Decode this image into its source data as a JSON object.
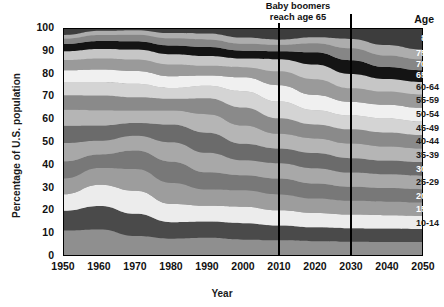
{
  "chart_data": {
    "type": "area",
    "title": "",
    "xlabel": "Year",
    "ylabel": "Percentage of U.S. population",
    "xlim": [
      1950,
      2050
    ],
    "ylim": [
      0,
      100
    ],
    "xticks": [
      "1950",
      "1960",
      "1970",
      "1980",
      "1990",
      "2000",
      "2010",
      "2020",
      "2030",
      "2040",
      "2050"
    ],
    "yticks": [
      "0",
      "10",
      "20",
      "30",
      "40",
      "50",
      "60",
      "70",
      "80",
      "90",
      "100"
    ],
    "grid": false,
    "legend_position": "right-overlay",
    "legend_header": "Age",
    "stacking": "percent",
    "annotations": [
      {
        "text": "Baby boomers reach age 65",
        "year": 2010
      },
      {
        "text": "",
        "year": 2030
      }
    ],
    "marker_years": [
      2010,
      2030
    ],
    "x": [
      1950,
      1960,
      1970,
      1980,
      1990,
      2000,
      2010,
      2020,
      2030,
      2040,
      2050
    ],
    "series": [
      {
        "name": "0-4",
        "color": "#8f8f8f",
        "values": [
          10.8,
          11.3,
          8.4,
          7.2,
          7.6,
          6.8,
          6.5,
          6.1,
          5.9,
          5.8,
          5.7
        ]
      },
      {
        "name": "5-9",
        "color": "#4a4a4a",
        "values": [
          8.8,
          10.4,
          9.8,
          7.3,
          7.2,
          7.3,
          6.6,
          6.2,
          6.0,
          5.9,
          5.8
        ]
      },
      {
        "name": "10-14",
        "color": "#ececec",
        "values": [
          7.3,
          9.4,
          10.2,
          8.1,
          7.0,
          7.3,
          6.7,
          6.3,
          6.0,
          5.9,
          5.8
        ]
      },
      {
        "name": "15-19",
        "color": "#9d9d9d",
        "values": [
          7.0,
          7.4,
          9.6,
          9.3,
          7.2,
          7.2,
          7.0,
          6.4,
          6.1,
          6.0,
          5.9
        ]
      },
      {
        "name": "20-24",
        "color": "#787878",
        "values": [
          7.6,
          6.0,
          8.2,
          9.4,
          7.6,
          6.7,
          7.0,
          6.6,
          6.2,
          6.0,
          5.9
        ]
      },
      {
        "name": "25-29",
        "color": "#a8a8a8",
        "values": [
          8.1,
          6.1,
          6.6,
          8.6,
          8.6,
          6.6,
          6.8,
          6.8,
          6.3,
          6.1,
          6.0
        ]
      },
      {
        "name": "30-34",
        "color": "#6b6b6b",
        "values": [
          7.6,
          6.7,
          5.6,
          7.8,
          8.9,
          7.3,
          6.5,
          6.7,
          6.4,
          6.1,
          6.0
        ]
      },
      {
        "name": "35-39",
        "color": "#b5b5b5",
        "values": [
          7.1,
          6.8,
          5.5,
          6.2,
          8.2,
          8.1,
          6.5,
          6.5,
          6.5,
          6.2,
          6.0
        ]
      },
      {
        "name": "40-44",
        "color": "#8a8a8a",
        "values": [
          6.4,
          6.5,
          5.9,
          5.2,
          7.1,
          8.0,
          6.9,
          6.2,
          6.3,
          6.2,
          6.0
        ]
      },
      {
        "name": "45-49",
        "color": "#d4d4d4",
        "values": [
          5.8,
          6.0,
          6.0,
          4.8,
          5.5,
          7.2,
          7.4,
          6.3,
          6.1,
          6.2,
          6.0
        ]
      },
      {
        "name": "50-54",
        "color": "#f0f0f0",
        "values": [
          5.2,
          5.5,
          5.6,
          5.2,
          4.5,
          6.1,
          7.2,
          6.7,
          6.0,
          6.1,
          6.0
        ]
      },
      {
        "name": "55-59",
        "color": "#9a9a9a",
        "values": [
          4.6,
          4.9,
          5.1,
          5.2,
          4.3,
          4.5,
          6.2,
          7.0,
          6.1,
          5.8,
          5.9
        ]
      },
      {
        "name": "60-64",
        "color": "#c6c6c6",
        "values": [
          3.9,
          4.2,
          4.4,
          4.5,
          4.3,
          3.8,
          5.3,
          6.5,
          6.3,
          5.6,
          5.6
        ]
      },
      {
        "name": "65-69",
        "color": "#141414",
        "values": [
          3.2,
          3.5,
          3.7,
          3.9,
          4.0,
          3.5,
          3.6,
          5.4,
          6.1,
          5.3,
          5.2
        ]
      },
      {
        "name": "70-74",
        "color": "#868686",
        "values": [
          2.4,
          2.7,
          2.9,
          3.2,
          3.4,
          3.1,
          2.8,
          4.0,
          5.3,
          5.1,
          4.8
        ]
      },
      {
        "name": "75-79",
        "color": "#adadad",
        "values": [
          1.6,
          1.8,
          2.0,
          2.3,
          2.6,
          2.7,
          2.3,
          2.6,
          4.1,
          4.6,
          4.3
        ]
      },
      {
        "name": "80 +",
        "color": "#3d3d3d",
        "values": [
          2.6,
          0.8,
          0.5,
          1.8,
          2.0,
          3.8,
          4.7,
          3.7,
          4.4,
          7.1,
          9.1
        ]
      }
    ]
  },
  "axis": {
    "ylabel": "Percentage of U.S. population",
    "xlabel": "Year"
  },
  "legend": {
    "header": "Age",
    "items": [
      {
        "label": "80 +",
        "tone": "dark"
      },
      {
        "label": "75-79",
        "tone": "dark"
      },
      {
        "label": "70-74",
        "tone": "dark"
      },
      {
        "label": "65-69",
        "tone": "dark"
      },
      {
        "label": "60-64",
        "tone": "light"
      },
      {
        "label": "55-59",
        "tone": "light"
      },
      {
        "label": "50-54",
        "tone": "light"
      },
      {
        "label": "45-49",
        "tone": "light"
      },
      {
        "label": "40-44",
        "tone": "light"
      },
      {
        "label": "35-39",
        "tone": "light"
      },
      {
        "label": "30-34",
        "tone": "dark"
      },
      {
        "label": "25-29",
        "tone": "light"
      },
      {
        "label": "20-24",
        "tone": "dark"
      },
      {
        "label": "15-19",
        "tone": "dark"
      },
      {
        "label": "10-14",
        "tone": "light"
      },
      {
        "label": "5-9",
        "tone": "dark"
      },
      {
        "label": "0-4",
        "tone": "dark"
      }
    ]
  },
  "annotation": {
    "text": "Baby boomers reach age 65"
  }
}
